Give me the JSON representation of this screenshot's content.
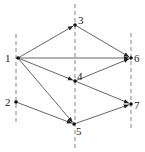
{
  "diagram": {
    "type": "directed-graph",
    "layers": [
      {
        "x": 16,
        "y1": 34,
        "y2": 122
      },
      {
        "x": 75,
        "y1": 4,
        "y2": 150
      },
      {
        "x": 131,
        "y1": 33,
        "y2": 128
      }
    ],
    "nodes": [
      {
        "id": "1",
        "label": "1",
        "x": 18,
        "y": 58,
        "lx": 5,
        "ly": 62
      },
      {
        "id": "2",
        "label": "2",
        "x": 16,
        "y": 102,
        "lx": 5,
        "ly": 106
      },
      {
        "id": "3",
        "label": "3",
        "x": 75,
        "y": 25,
        "lx": 78,
        "ly": 24
      },
      {
        "id": "4",
        "label": "4",
        "x": 75,
        "y": 81,
        "lx": 77,
        "ly": 80
      },
      {
        "id": "5",
        "label": "5",
        "x": 74,
        "y": 124,
        "lx": 76,
        "ly": 135
      },
      {
        "id": "6",
        "label": "6",
        "x": 131,
        "y": 58,
        "lx": 134,
        "ly": 62
      },
      {
        "id": "7",
        "label": "7",
        "x": 131,
        "y": 104,
        "lx": 134,
        "ly": 109
      }
    ],
    "edges": [
      {
        "from": "1",
        "to": "3"
      },
      {
        "from": "1",
        "to": "6"
      },
      {
        "from": "1",
        "to": "4"
      },
      {
        "from": "1",
        "to": "5"
      },
      {
        "from": "2",
        "to": "5"
      },
      {
        "from": "3",
        "to": "6"
      },
      {
        "from": "4",
        "to": "6"
      },
      {
        "from": "4",
        "to": "7"
      },
      {
        "from": "5",
        "to": "7"
      }
    ],
    "colors": {
      "edge": "#555555",
      "node": "#111111",
      "dash": "#666666",
      "label": "#222222"
    }
  }
}
